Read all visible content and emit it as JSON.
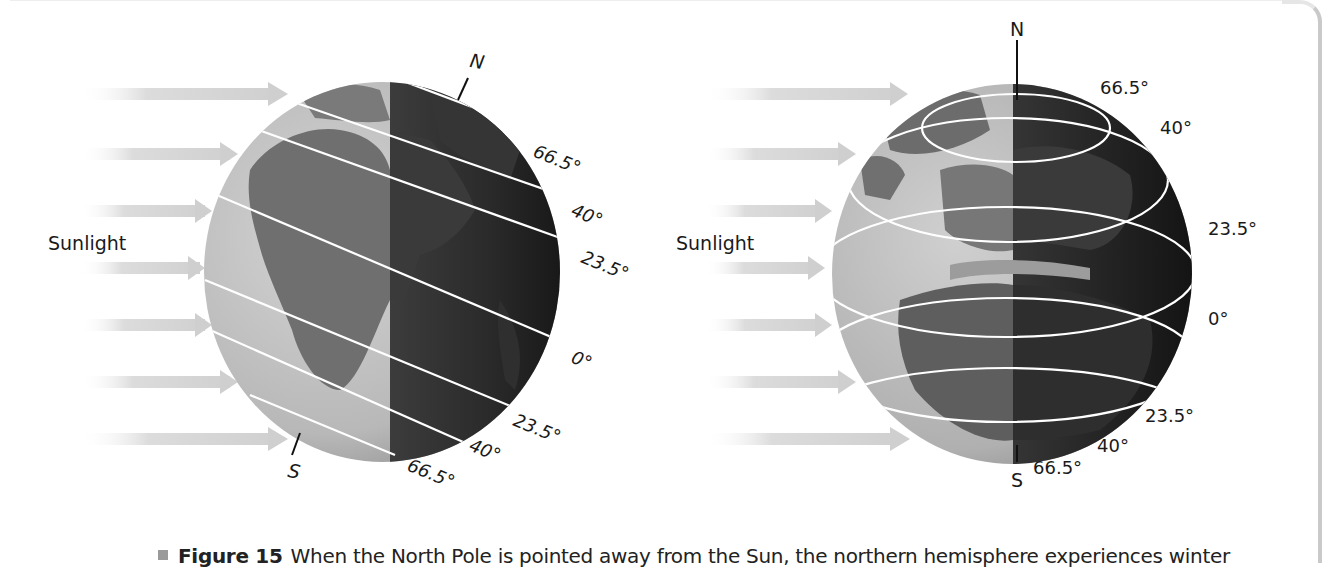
{
  "figure": {
    "number_label": "Figure 15",
    "caption_text": "When the North Pole is pointed away from the Sun, the northern hemisphere experiences winter"
  },
  "colors": {
    "arrow": "#d9d9d9",
    "globe_light": "#c8c8c8",
    "globe_dark": "#1e1e1e",
    "land_light": "#7a7a7a",
    "land_dark": "#3a3a3a",
    "latitude_line": "#ffffff",
    "label_text": "#1a1a1a",
    "frame_border": "#c9c9c9"
  },
  "left_panel": {
    "sunlight_label": "Sunlight",
    "north_label": "N",
    "south_label": "S",
    "latitude_labels": {
      "n66": "66.5°",
      "n40": "40°",
      "n23": "23.5°",
      "eq": "0°",
      "s23": "23.5°",
      "s40": "40°",
      "s66": "66.5°"
    },
    "arrow_count": 7,
    "view": "side view, axis tilted 23.5° away from the Sun"
  },
  "right_panel": {
    "sunlight_label": "Sunlight",
    "north_label": "N",
    "south_label": "S",
    "latitude_labels": {
      "n66": "66.5°",
      "n40": "40°",
      "n23": "23.5°",
      "eq": "0°",
      "s23": "23.5°",
      "s40": "40°",
      "s66": "66.5°"
    },
    "arrow_count": 7,
    "view": "globe viewed from the Sun's direction, Europe/Africa visible"
  }
}
